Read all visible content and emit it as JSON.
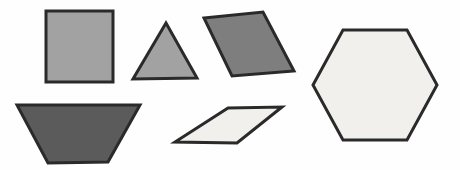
{
  "figure": {
    "background": "#fefefe",
    "stroke_color": "#2a2a2a",
    "stroke_width": 3,
    "canvas": {
      "width": 460,
      "height": 170
    }
  },
  "shapes": [
    {
      "name": "square",
      "fill": "#a2a2a2",
      "points": [
        [
          46,
          11
        ],
        [
          113,
          11
        ],
        [
          113,
          82
        ],
        [
          46,
          82
        ]
      ]
    },
    {
      "name": "triangle",
      "fill": "#a2a2a2",
      "points": [
        [
          166,
          23
        ],
        [
          197,
          78
        ],
        [
          133,
          79
        ]
      ]
    },
    {
      "name": "dark-parallelogram",
      "fill": "#7e7e7e",
      "points": [
        [
          204,
          18
        ],
        [
          263,
          12
        ],
        [
          294,
          71
        ],
        [
          232,
          76
        ]
      ]
    },
    {
      "name": "trapezoid",
      "fill": "#5b5b5b",
      "points": [
        [
          17,
          105
        ],
        [
          140,
          105
        ],
        [
          108,
          162
        ],
        [
          48,
          163
        ]
      ]
    },
    {
      "name": "light-parallelogram",
      "fill": "#f1f0ec",
      "points": [
        [
          228,
          108
        ],
        [
          282,
          107
        ],
        [
          237,
          143
        ],
        [
          175,
          142
        ]
      ]
    },
    {
      "name": "hexagon",
      "fill": "#f1f0ec",
      "points": [
        [
          343,
          30
        ],
        [
          407,
          30
        ],
        [
          437,
          85
        ],
        [
          407,
          140
        ],
        [
          343,
          140
        ],
        [
          313,
          85
        ]
      ]
    }
  ]
}
